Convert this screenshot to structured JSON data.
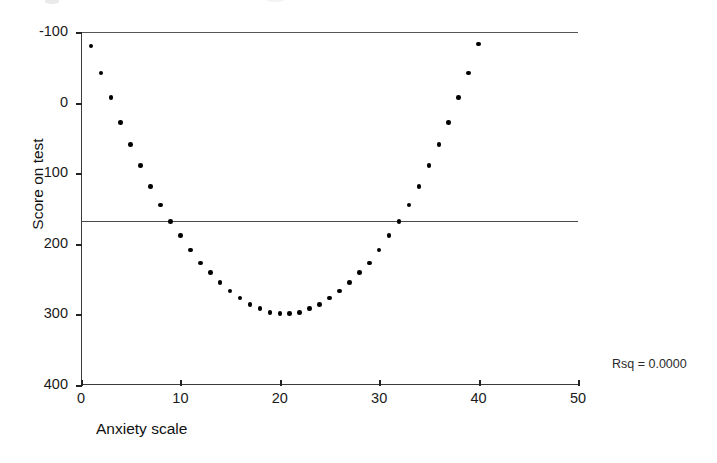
{
  "figure": {
    "background_color": "#ffffff",
    "axis_color": "#3a3a3a",
    "point_color": "#000000",
    "reference_line_color": "#4a4a4a"
  },
  "annotations": {
    "rsq_label": "Rsq = 0.0000"
  },
  "axes": {
    "x_title": "Anxiety scale",
    "y_title": "Score on test",
    "x_ticks": [
      "0",
      "10",
      "20",
      "30",
      "40",
      "50"
    ],
    "y_ticks": [
      "400",
      "300",
      "200",
      "100",
      "0",
      "-100"
    ]
  },
  "chart_data": {
    "type": "scatter",
    "title": "",
    "xlabel": "Anxiety scale",
    "ylabel": "Score on test",
    "xlim": [
      0,
      50
    ],
    "ylim": [
      -100,
      400
    ],
    "xticks": [
      0,
      10,
      20,
      30,
      40,
      50
    ],
    "yticks": [
      -100,
      0,
      100,
      200,
      300,
      400
    ],
    "grid": false,
    "legend": null,
    "annotations": [
      {
        "text": "Rsq = 0.0000",
        "position": "outside-right-bottom"
      }
    ],
    "reference_line": {
      "type": "horizontal",
      "y": 133,
      "description": "fitted linear regression line, slope 0"
    },
    "x": [
      1,
      2,
      3,
      4,
      5,
      6,
      7,
      8,
      9,
      10,
      11,
      12,
      13,
      14,
      15,
      16,
      17,
      18,
      19,
      20,
      21,
      22,
      23,
      24,
      25,
      26,
      27,
      28,
      29,
      30,
      31,
      32,
      33,
      34,
      35,
      36,
      37,
      38,
      39,
      40
    ],
    "y": [
      380,
      342,
      307,
      272,
      241,
      211,
      181,
      155,
      132,
      112,
      91,
      73,
      59,
      45,
      33,
      23,
      14,
      8,
      3,
      1,
      1,
      3,
      8,
      14,
      23,
      33,
      45,
      59,
      73,
      91,
      112,
      132,
      155,
      181,
      211,
      241,
      272,
      307,
      342,
      383
    ],
    "series": [
      {
        "name": "Score on test",
        "marker": "filled-circle",
        "color": "#000000"
      }
    ]
  }
}
